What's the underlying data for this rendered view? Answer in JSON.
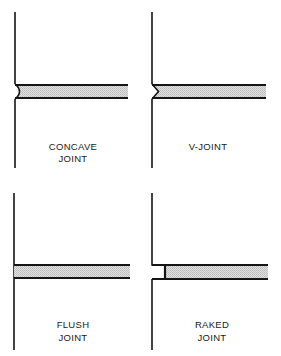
{
  "diagram": {
    "colors": {
      "line": "#151515",
      "mortar_fill": "#d4d4d4",
      "background": "#ffffff"
    },
    "panels": [
      {
        "id": "concave",
        "label_line1": "CONCAVE",
        "label_line2": "JOINT",
        "profile": "concave"
      },
      {
        "id": "v-joint",
        "label_line1": "V-JOINT",
        "label_line2": "",
        "profile": "v"
      },
      {
        "id": "flush",
        "label_line1": "FLUSH",
        "label_line2": "JOINT",
        "profile": "flush"
      },
      {
        "id": "raked",
        "label_line1": "RAKED",
        "label_line2": "JOINT",
        "profile": "raked"
      }
    ]
  }
}
